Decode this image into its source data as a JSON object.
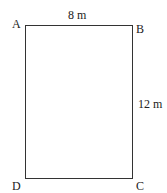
{
  "diagram": {
    "type": "rectangle",
    "vertices": [
      {
        "name": "A",
        "position": "top-left"
      },
      {
        "name": "B",
        "position": "top-right"
      },
      {
        "name": "C",
        "position": "bottom-right"
      },
      {
        "name": "D",
        "position": "bottom-left"
      }
    ],
    "dimensions": {
      "top": "8 m",
      "right": "12 m"
    }
  }
}
